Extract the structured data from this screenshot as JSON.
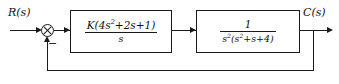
{
  "diagram": {
    "type": "control-system-block-diagram",
    "input": {
      "label": "R(s)"
    },
    "output": {
      "label": "C(s)"
    },
    "summing_junction": {
      "name": "summing-junction",
      "symbol": "crossed-circle",
      "feedback_sign": "−"
    },
    "blocks": [
      {
        "id": "controller",
        "name": "controller-block",
        "numerator": "K(4s<sup>2</sup>+2s+1)",
        "denominator": "s",
        "transfer_function": "K(4s^2+2s+1)/s"
      },
      {
        "id": "plant",
        "name": "plant-block",
        "numerator": "1",
        "denominator": "s<sup>2</sup>(s<sup>2</sup>+s+4)",
        "transfer_function": "1/(s^2(s^2+s+4))"
      }
    ],
    "feedback_path": {
      "name": "feedback-path",
      "gain": "unity"
    },
    "colors": {
      "line": "#1a1a1a",
      "background": "#ffffff",
      "text": "#111111"
    }
  }
}
